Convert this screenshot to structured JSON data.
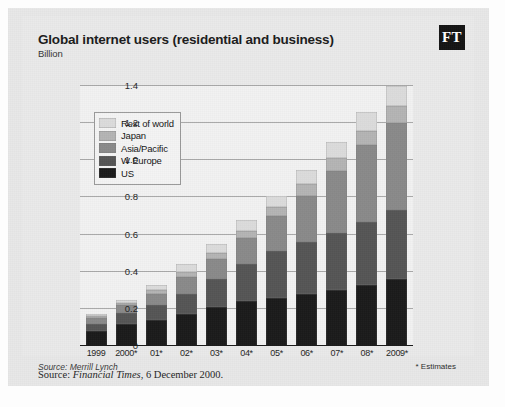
{
  "logo": {
    "text": "FT",
    "name": "financial-times-logo"
  },
  "chart": {
    "title": "Global internet users (residential and business)",
    "subtitle": "Billion",
    "source": "Source: Merrill Lynch",
    "estimates_note": "* Estimates"
  },
  "caption": {
    "prefix": "Source: ",
    "publication": "Financial Times",
    "suffix": ", 6 December 2000."
  },
  "colors": {
    "us": "#1a1a1a",
    "w_europe": "#555555",
    "asia_pacific": "#8a8a8a",
    "japan": "#b4b4b4",
    "rest_of_world": "#dcdcdc",
    "panel": "#e8e8e8",
    "plot": "#f2f2f2",
    "gridline": "#a9a9a9"
  },
  "chart_data": {
    "type": "bar",
    "title": "Global internet users (residential and business)",
    "subtitle": "Billion",
    "xlabel": "",
    "ylabel": "Billion",
    "ylim": [
      0,
      1.4
    ],
    "yticks": [
      "0",
      "0.2",
      "0.4",
      "0.6",
      "0.8",
      "1.0",
      "1.2",
      "1.4"
    ],
    "ytick_values": [
      0,
      0.2,
      0.4,
      0.6,
      0.8,
      1.0,
      1.2,
      1.4
    ],
    "grid": true,
    "stacked": true,
    "legend_position": "top-left-inside",
    "categories": [
      "1999",
      "2000*",
      "01*",
      "02*",
      "03*",
      "04*",
      "05*",
      "06*",
      "07*",
      "08*",
      "2009*"
    ],
    "series": [
      {
        "name": "US",
        "color": "#1a1a1a",
        "values": [
          0.08,
          0.12,
          0.14,
          0.17,
          0.21,
          0.24,
          0.26,
          0.28,
          0.3,
          0.33,
          0.36
        ]
      },
      {
        "name": "W Europe",
        "color": "#555555",
        "values": [
          0.04,
          0.06,
          0.08,
          0.11,
          0.15,
          0.2,
          0.25,
          0.28,
          0.31,
          0.34,
          0.37
        ]
      },
      {
        "name": "Asia/Pacific",
        "color": "#8a8a8a",
        "values": [
          0.03,
          0.04,
          0.06,
          0.09,
          0.11,
          0.14,
          0.19,
          0.25,
          0.33,
          0.41,
          0.47
        ]
      },
      {
        "name": "Japan",
        "color": "#b4b4b4",
        "values": [
          0.01,
          0.01,
          0.02,
          0.03,
          0.03,
          0.04,
          0.05,
          0.06,
          0.07,
          0.08,
          0.09
        ]
      },
      {
        "name": "Rest of world",
        "color": "#dcdcdc",
        "values": [
          0.01,
          0.02,
          0.03,
          0.04,
          0.05,
          0.06,
          0.06,
          0.08,
          0.09,
          0.1,
          0.11
        ]
      }
    ],
    "totals": [
      0.17,
      0.25,
      0.33,
      0.44,
      0.55,
      0.68,
      0.81,
      0.95,
      1.1,
      1.26,
      1.4
    ],
    "legend": [
      "Rest of world",
      "Japan",
      "Asia/Pacific",
      "W Europe",
      "US"
    ]
  }
}
